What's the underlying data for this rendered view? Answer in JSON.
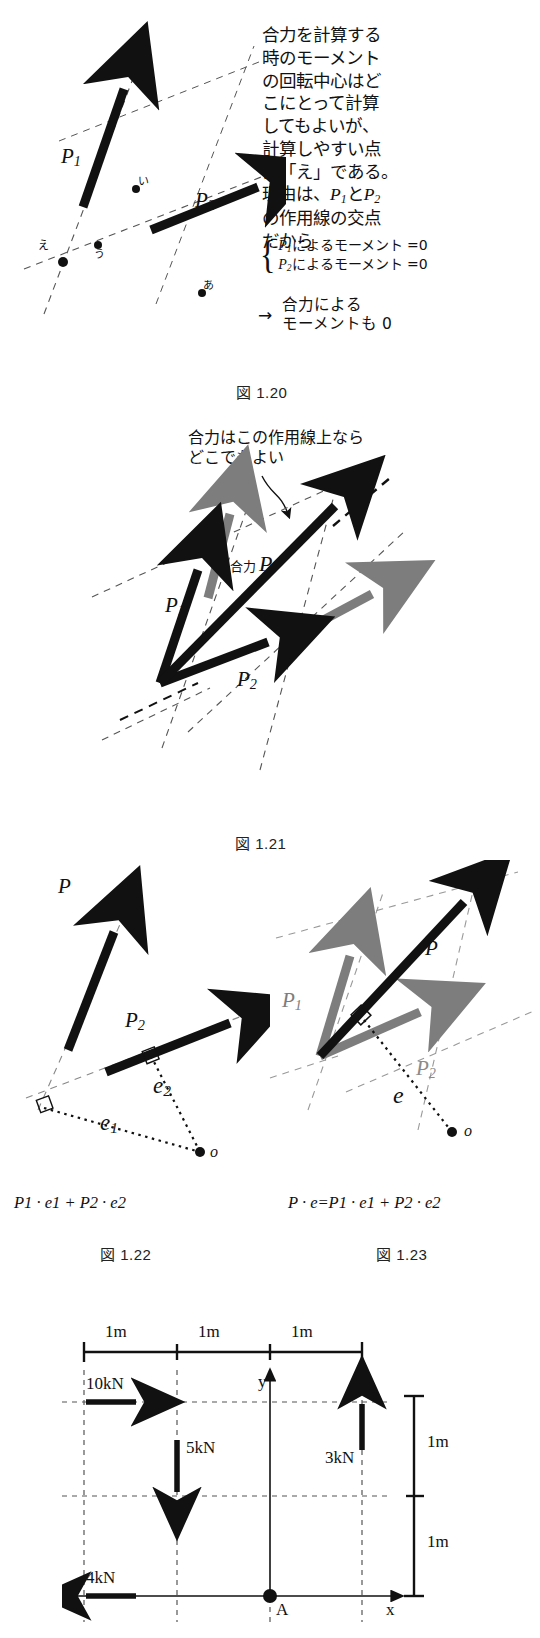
{
  "page": {
    "width": 540,
    "height": 1638
  },
  "fig120": {
    "caption": "図 1.20",
    "paragraph_lines": [
      "合力を計算する",
      "時のモーメント",
      "の回転中心はど",
      "こにとって計算",
      "してもよいが、",
      "計算しやすい点",
      "は「え」である。",
      "の作用線の交点",
      "だから"
    ],
    "reason_line_prefix": "理由は、",
    "reason_P1": "P",
    "reason_P1_sub": "1",
    "reason_mid": "と",
    "reason_P2": "P",
    "reason_P2_sub": "2",
    "eq1_prefix": "P",
    "eq1_sub": "1",
    "eq1_text": "によるモーメント =0",
    "eq2_prefix": "P",
    "eq2_sub": "2",
    "eq2_text": "によるモーメント =0",
    "conclusion_l1": "合力による",
    "conclusion_l2": "モーメントも 0",
    "conclusion_arrow": "→",
    "vector_P1": "P",
    "vector_P1_sub": "1",
    "vector_P2": "P",
    "vector_P2_sub": "2",
    "points": [
      "あ",
      "い",
      "う",
      "え"
    ]
  },
  "fig121": {
    "caption": "図 1.21",
    "note_l1": "合力はこの作用線上なら",
    "note_l2": "どこでもよい",
    "label_resultant_jp": "合力",
    "label_resultant_sym": "P",
    "vector_P1": "P",
    "vector_P1_sub": "1",
    "vector_P2": "P",
    "vector_P2_sub": "2"
  },
  "fig122": {
    "caption": "図 1.22",
    "vector_P": "P",
    "vector_P2": "P",
    "vector_P2_sub": "2",
    "dist_e1": "e",
    "dist_e1_sub": "1",
    "dist_e2": "e",
    "dist_e2_sub": "2",
    "origin_label": "o",
    "equation": {
      "terms": [
        "P",
        "1",
        "·",
        "e",
        "1",
        "+",
        "P",
        "2",
        "·",
        "e",
        "2"
      ],
      "plain": "P1 · e1 + P2 · e2"
    }
  },
  "fig123": {
    "caption": "図 1.23",
    "vector_P": "P",
    "vector_P1": "P",
    "vector_P1_sub": "1",
    "vector_P2": "P",
    "vector_P2_sub": "2",
    "dist_e": "e",
    "origin_label": "o",
    "equation": {
      "plain": "P · e=P1 · e1 + P2 · e2"
    },
    "gray_color": "#7d7d7d"
  },
  "fig_bottom": {
    "top_dims": [
      "1m",
      "1m",
      "1m"
    ],
    "right_dims": [
      "1m",
      "1m"
    ],
    "forces": [
      {
        "label": "10kN",
        "direction": "right"
      },
      {
        "label": "5kN",
        "direction": "down"
      },
      {
        "label": "3kN",
        "direction": "up"
      },
      {
        "label": "4kN",
        "direction": "left"
      }
    ],
    "axis_x": "x",
    "axis_y": "y",
    "origin_point": "A"
  },
  "colors": {
    "ink": "#111111",
    "gray_vector": "#7d7d7d",
    "dash": "#555555"
  }
}
